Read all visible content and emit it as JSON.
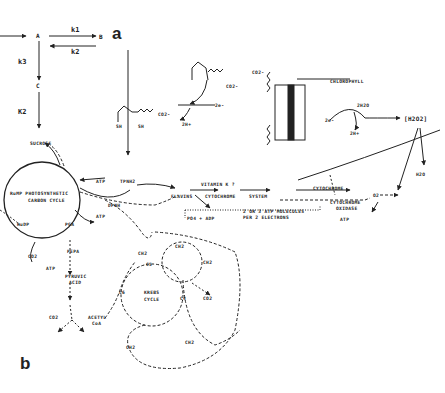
{
  "panel_a": {
    "label": "a",
    "nodes": {
      "A": "A",
      "B": "B",
      "C": "C"
    },
    "rates": {
      "k1": "k1",
      "k2_back": "k2",
      "k3": "k3",
      "K2": "K2"
    }
  },
  "panel_b": {
    "label": "b",
    "labels": {
      "sucrose": "SUCROSE",
      "cycle1": "RuMP PHOTOSYNTHETIC",
      "cycle2": "CARBON CYCLE",
      "rudp": "RuDP",
      "pga": "PGA",
      "pepa": "PEPA",
      "atp1": "ATP",
      "atp2": "ATP",
      "atp3": "ATP",
      "atp4": "ATP",
      "co2_1": "CO2",
      "co2_2": "CO2",
      "co2_3": "CO2",
      "co2_4": "CO2",
      "pyruvic1": "PYRUVIC",
      "pyruvic2": "ACID",
      "acetyl1": "ACETYL",
      "acetyl2": "CoA",
      "krebs1": "KREBS",
      "krebs2": "CYCLE",
      "c6": "C6",
      "c4a": "C4",
      "c4b": "C4",
      "c5": "C5",
      "ch2a": "CH2",
      "ch2b": "CH2",
      "ch2c": "CH2",
      "ch2d": "CH2",
      "ch2e": "CH2",
      "tpnh": "TPNH2",
      "dpnh": "DPNH",
      "flavins": "FLAVINS",
      "vitk": "VITAMIN K ?",
      "cyto_b": "CYTOCHROME",
      "system": "SYSTEM",
      "cyto_c": "CYTOCHROME",
      "cyto_ox1": "CYTOCHROME",
      "cyto_ox2": "OXIDASE",
      "o2": "O2",
      "atp_mol1": "2 OR 3 ATP MOLECULES",
      "atp_mol2": "PER 2 ELECTRONS",
      "po4_adp": "PO4 + ADP",
      "chlorophyll": "CHLOROPHYLL",
      "co2_lipo": "CO2-",
      "co2_lipo2": "CO2-",
      "co2_lipo3": "CO2-",
      "sh1": "SH",
      "sh2": "SH",
      "twoe_1": "2e-",
      "twoh_1": "2H+",
      "h2o": "2H2O",
      "twoe_2": "2e-",
      "twoh_2": "2H+",
      "h2o2": "[H2O2]",
      "h2o_out": "H2O",
      "s1": "S",
      "s2": "S"
    }
  }
}
